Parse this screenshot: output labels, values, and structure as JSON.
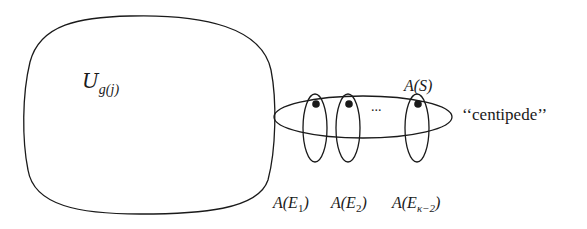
{
  "diagram": {
    "universe_label": {
      "main": "U",
      "subscript": "g(j)"
    },
    "set_label": {
      "main": "A",
      "arg": "S"
    },
    "centipede_label": "‘‘centipede’’",
    "ellipsis": "...",
    "legs": [
      {
        "main": "A",
        "base": "E",
        "subscript": "1"
      },
      {
        "main": "A",
        "base": "E",
        "subscript": "2"
      },
      {
        "main": "A",
        "base": "E",
        "subscript": "κ−2"
      }
    ],
    "colors": {
      "stroke": "#1a1a1a",
      "background": "#ffffff"
    }
  }
}
